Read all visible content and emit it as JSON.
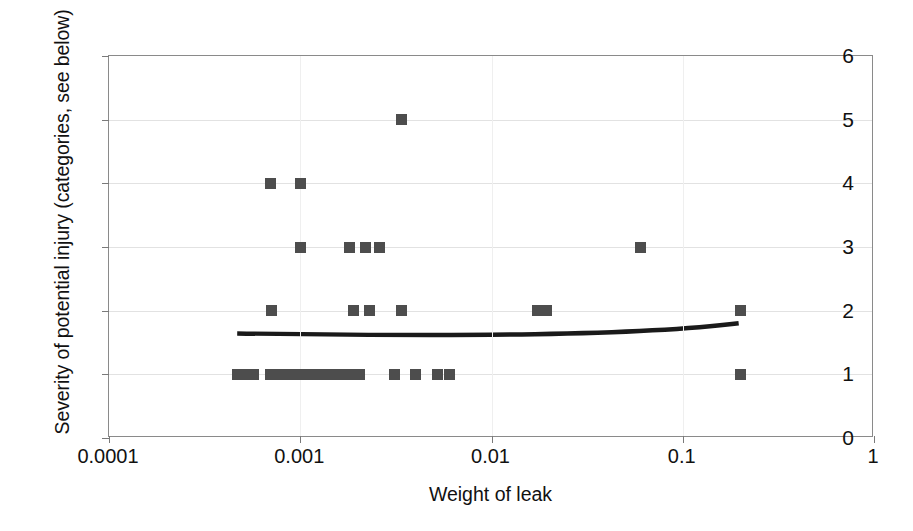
{
  "chart_data": {
    "type": "scatter",
    "title": "",
    "xlabel": "Weight of leak",
    "ylabel": "Severity of potential injury (categories, see below)",
    "xscale": "log",
    "xlim": [
      0.0001,
      1
    ],
    "ylim": [
      0,
      6
    ],
    "xticks": [
      0.0001,
      0.001,
      0.01,
      0.1,
      1
    ],
    "xtick_labels": [
      "0.0001",
      "0.001",
      "0.01",
      "0.1",
      "1"
    ],
    "yticks": [
      0,
      1,
      2,
      3,
      4,
      5,
      6
    ],
    "ytick_labels": [
      "0",
      "1",
      "2",
      "3",
      "4",
      "5",
      "6"
    ],
    "grid": "horizontal",
    "legend": "none",
    "marker": "filled-square",
    "marker_color": "#4d4d4d",
    "points": [
      {
        "x": 0.00047,
        "y": 1
      },
      {
        "x": 0.00052,
        "y": 1
      },
      {
        "x": 0.00057,
        "y": 1
      },
      {
        "x": 0.0007,
        "y": 1
      },
      {
        "x": 0.00076,
        "y": 1
      },
      {
        "x": 0.00082,
        "y": 1
      },
      {
        "x": 0.00089,
        "y": 1
      },
      {
        "x": 0.00097,
        "y": 1
      },
      {
        "x": 0.00105,
        "y": 1
      },
      {
        "x": 0.00118,
        "y": 1
      },
      {
        "x": 0.00128,
        "y": 1
      },
      {
        "x": 0.00139,
        "y": 1
      },
      {
        "x": 0.00151,
        "y": 1
      },
      {
        "x": 0.00164,
        "y": 1
      },
      {
        "x": 0.00178,
        "y": 1
      },
      {
        "x": 0.00205,
        "y": 1
      },
      {
        "x": 0.0031,
        "y": 1
      },
      {
        "x": 0.004,
        "y": 1
      },
      {
        "x": 0.0052,
        "y": 1
      },
      {
        "x": 0.006,
        "y": 1
      },
      {
        "x": 0.2,
        "y": 1
      },
      {
        "x": 0.00071,
        "y": 2
      },
      {
        "x": 0.0019,
        "y": 2
      },
      {
        "x": 0.0023,
        "y": 2
      },
      {
        "x": 0.0034,
        "y": 2
      },
      {
        "x": 0.0175,
        "y": 2
      },
      {
        "x": 0.0195,
        "y": 2
      },
      {
        "x": 0.2,
        "y": 2
      },
      {
        "x": 0.001,
        "y": 3
      },
      {
        "x": 0.0018,
        "y": 3
      },
      {
        "x": 0.0022,
        "y": 3
      },
      {
        "x": 0.0026,
        "y": 3
      },
      {
        "x": 0.06,
        "y": 3
      },
      {
        "x": 0.0007,
        "y": 4
      },
      {
        "x": 0.001,
        "y": 4
      },
      {
        "x": 0.0034,
        "y": 5
      }
    ],
    "trendline": {
      "name": "fitted curve",
      "color": "#1a1a1a",
      "x_start": 0.00047,
      "x_end": 0.2,
      "y_start": 1.62,
      "y_end": 1.78,
      "y_min": 1.6,
      "shape": "shallow-upward-curve"
    }
  }
}
